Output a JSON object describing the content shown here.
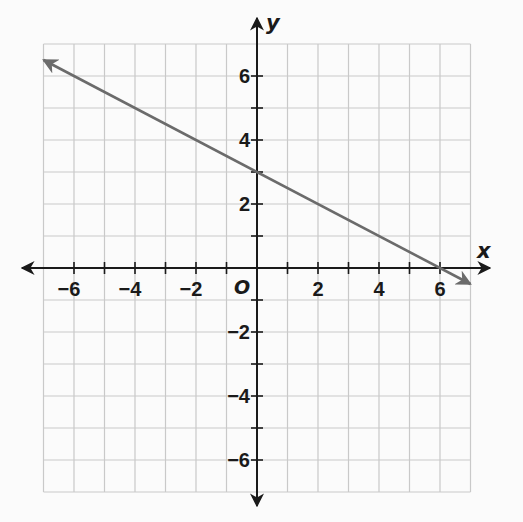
{
  "chart_data": {
    "type": "line",
    "title": "",
    "xlabel": "x",
    "ylabel": "y",
    "origin_label": "O",
    "xlim": [
      -7,
      7
    ],
    "ylim": [
      -7,
      7
    ],
    "grid": true,
    "grid_step": 1,
    "x_tick_labels": [
      "−6",
      "−4",
      "−2",
      "2",
      "4",
      "6"
    ],
    "x_tick_values": [
      -6,
      -4,
      -2,
      2,
      4,
      6
    ],
    "y_tick_labels": [
      "6",
      "4",
      "2",
      "−2",
      "−4",
      "−6"
    ],
    "y_tick_values": [
      6,
      4,
      2,
      -2,
      -4,
      -6
    ],
    "series": [
      {
        "name": "line",
        "equation": "y = -0.5x + 3",
        "slope": -0.5,
        "y_intercept": 3,
        "x_intercept": 6,
        "x": [
          -7,
          0,
          6,
          7
        ],
        "y": [
          6.5,
          3,
          0,
          -0.5
        ],
        "arrows": "both",
        "color": "#6b6b6b"
      }
    ],
    "colors": {
      "grid": "#c9c9c9",
      "axes": "#1a1a1a",
      "line": "#6b6b6b",
      "background": "#fbfbfb"
    }
  }
}
